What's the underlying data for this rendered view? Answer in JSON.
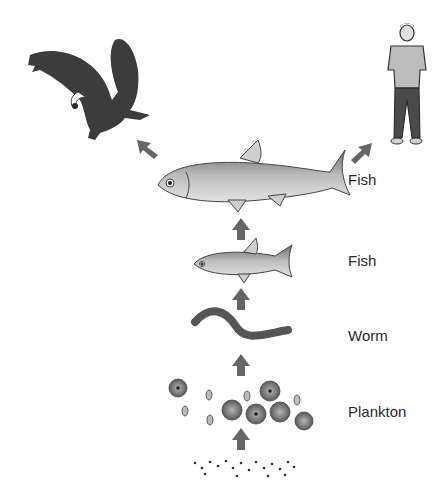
{
  "diagram": {
    "type": "food-chain",
    "levels": [
      {
        "id": "particles",
        "label": "",
        "icon": "particles-dots"
      },
      {
        "id": "plankton",
        "label": "Plankton",
        "icon": "plankton-cluster"
      },
      {
        "id": "worm",
        "label": "Worm",
        "icon": "worm"
      },
      {
        "id": "small-fish",
        "label": "Fish",
        "icon": "small-fish"
      },
      {
        "id": "large-fish",
        "label": "Fish",
        "icon": "large-fish"
      }
    ],
    "top_consumers": [
      {
        "id": "eagle",
        "label": "",
        "icon": "eagle"
      },
      {
        "id": "human",
        "label": "",
        "icon": "human"
      }
    ],
    "arrow_color": "#666666",
    "arrows": [
      {
        "from": "particles",
        "to": "plankton"
      },
      {
        "from": "plankton",
        "to": "worm"
      },
      {
        "from": "worm",
        "to": "small-fish"
      },
      {
        "from": "small-fish",
        "to": "large-fish"
      },
      {
        "from": "large-fish",
        "to": "eagle"
      },
      {
        "from": "large-fish",
        "to": "human"
      }
    ]
  }
}
